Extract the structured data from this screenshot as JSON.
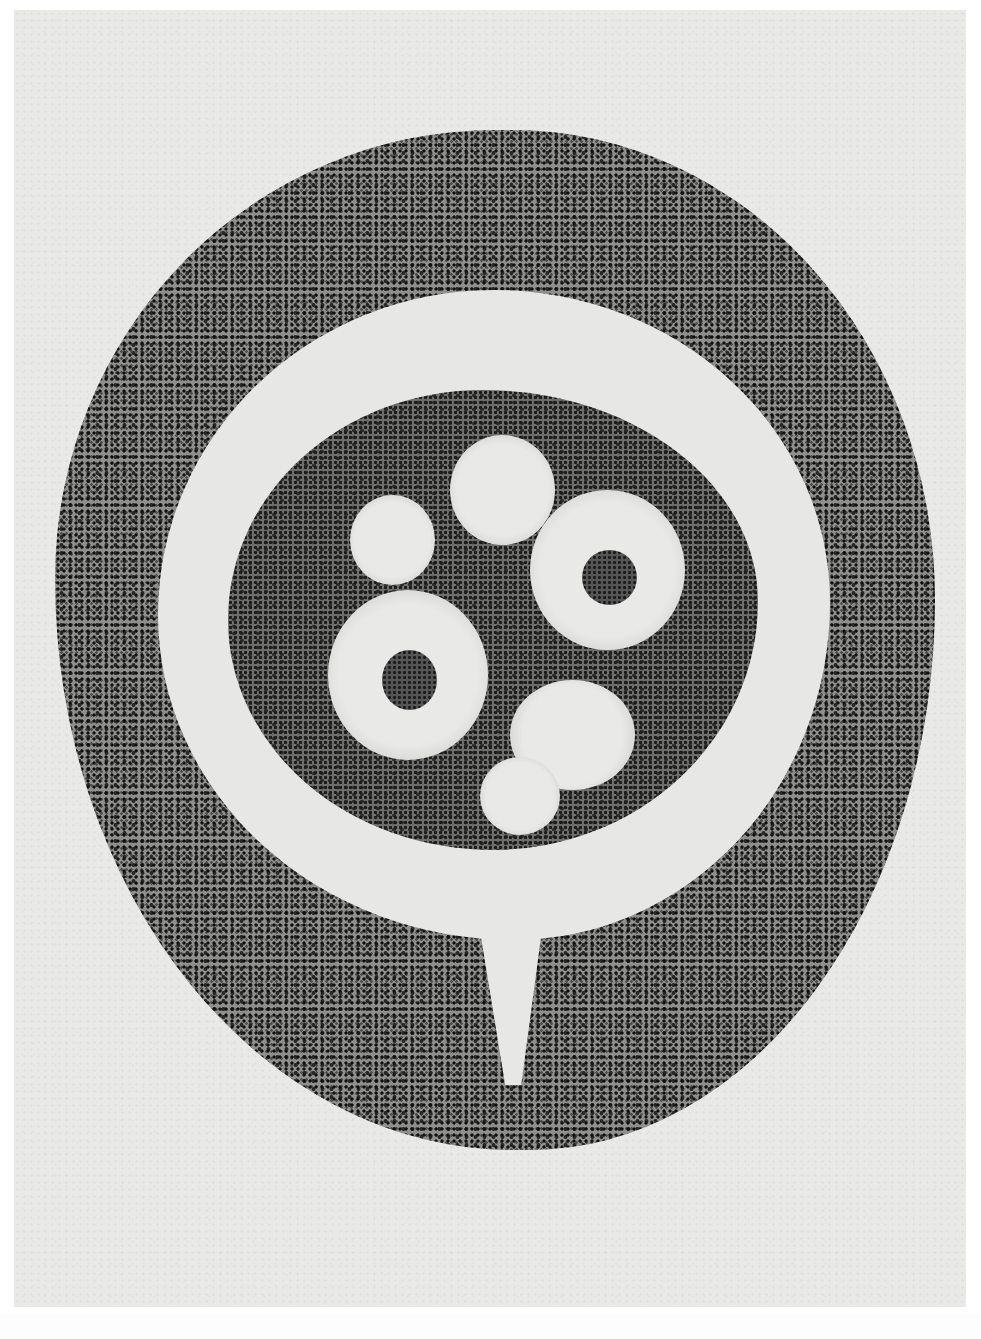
{
  "image": {
    "kind": "grayscale-micrograph",
    "subject": "histological cross-section of a round tissue structure with a clear ring surrounding a dense inner cell mass containing several pale vacuoles",
    "palette": {
      "background": "#e9e9e7",
      "stain_dark": "#1e1e1e",
      "stain_mid": "#8d8d8b",
      "clear_zone": "#e7e7e5"
    },
    "regions": [
      {
        "name": "outer-cellular-layer",
        "description": "thick granular stained ring"
      },
      {
        "name": "clear-ring",
        "description": "pale unstained zone between outer layer and inner mass, with a narrow stalk opening at the bottom"
      },
      {
        "name": "inner-cell-mass",
        "description": "dense granular cluster"
      },
      {
        "name": "vacuoles",
        "count": 6,
        "with_nuclei": 2
      }
    ],
    "text": []
  }
}
